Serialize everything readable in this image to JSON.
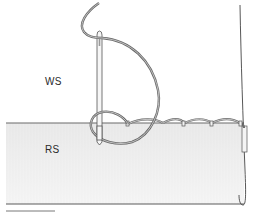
{
  "diagram": {
    "type": "sewing-illustration",
    "labels": {
      "wrong_side": "WS",
      "right_side": "RS"
    },
    "colors": {
      "background": "#ffffff",
      "fabric_rs_fill": "#ececec",
      "outline": "#4a4a4a",
      "thread": "#7a7a7a",
      "label_text": "#2a2a2a"
    },
    "elements": [
      "needle",
      "thread",
      "fabric-right-side",
      "fabric-fold",
      "stitches"
    ]
  }
}
